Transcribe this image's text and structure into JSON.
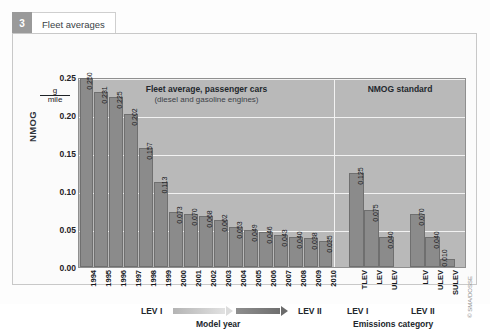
{
  "tab": {
    "number": "3",
    "label": "Fleet averages"
  },
  "axis": {
    "y_title": "NMOG",
    "unit_numerator": "g",
    "unit_denominator": "mile",
    "y_ticks": [
      "0.25",
      "0.20",
      "0.15",
      "0.10",
      "0.05",
      "0.00"
    ],
    "left_x_title": "Model year",
    "right_x_title": "Emissions category"
  },
  "left_panel": {
    "title": "Fleet average, passenger cars",
    "subtitle": "(diesel and gasoline engines)",
    "era_start": "LEV I",
    "era_end": "LEV II"
  },
  "right_panel": {
    "title": "NMOG standard",
    "group_labels": [
      "LEV I",
      "LEV II"
    ]
  },
  "credit": "© SMA/DOSSE",
  "chart_data": {
    "type": "bar",
    "title": "Fleet averages",
    "xlabel": "Model year / Emissions category",
    "ylabel": "NMOG",
    "yunit": "g/mile",
    "ylim": [
      0,
      0.25
    ],
    "ytick_values": [
      0.25,
      0.2,
      0.15,
      0.1,
      0.05,
      0.0
    ],
    "grid": true,
    "legend": "none",
    "panels": [
      {
        "name": "Fleet average, passenger cars",
        "subtitle": "(diesel and gasoline engines)",
        "categories": [
          "1994",
          "1995",
          "1996",
          "1997",
          "1998",
          "1999",
          "2000",
          "2001",
          "2002",
          "2003",
          "2004",
          "2005",
          "2006",
          "2007",
          "2008",
          "2009",
          "2010"
        ],
        "values": [
          0.25,
          0.231,
          0.225,
          0.202,
          0.157,
          0.113,
          0.073,
          0.07,
          0.068,
          0.062,
          0.053,
          0.049,
          0.046,
          0.043,
          0.04,
          0.038,
          0.035
        ],
        "labels": [
          "0.250",
          "0.231",
          "0.225",
          "0.202",
          "0.157",
          "0.113",
          "0.073",
          "0.070",
          "0.068",
          "0.062",
          "0.053",
          "0.049",
          "0.046",
          "0.043",
          "0.040",
          "0.038",
          "0.035"
        ]
      },
      {
        "name": "NMOG standard",
        "categories": [
          "TLEV",
          "LEV",
          "ULEV",
          "LEV",
          "ULEV",
          "SULEV"
        ],
        "groups": [
          "LEV I",
          "LEV I",
          "LEV I",
          "LEV II",
          "LEV II",
          "LEV II"
        ],
        "values": [
          0.125,
          0.075,
          0.04,
          0.07,
          0.04,
          0.01
        ],
        "labels": [
          "0.125",
          "0.075",
          "0.040",
          "0.070",
          "0.040",
          "0.010"
        ]
      }
    ]
  },
  "colors": {
    "plot_background": "#b9b9b9",
    "bar_fill": "#8b8b8b",
    "gridline": "#f2f2f2",
    "text": "#22272c"
  }
}
